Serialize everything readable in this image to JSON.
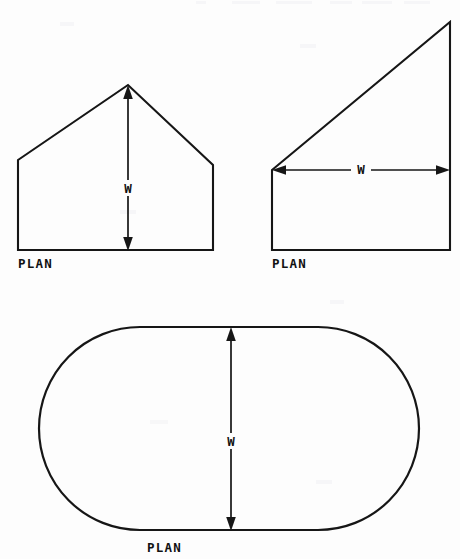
{
  "document": {
    "kind": "scanned-technical-diagram",
    "page_background": "#fdfdfd",
    "ink_color": "#161616",
    "top_artifact_text": ""
  },
  "figures": [
    {
      "id": "figure-pentagon",
      "name": "pentagon-gable-plan",
      "shape_type": "pentagon",
      "caption": "PLAN",
      "dimension": {
        "label": "W",
        "orientation": "vertical",
        "both_ends_arrow": true
      },
      "geometry": {
        "points": "18,160 128,85 213,165 213,250 18,250",
        "apex_x": 128,
        "apex_y": 85,
        "base_y": 250,
        "left_x": 18,
        "right_x": 213,
        "left_shoulder_y": 160,
        "right_shoulder_y": 165
      },
      "dim_geometry": {
        "x": 128,
        "y_top": 86,
        "y_bottom": 250,
        "label_y": 188
      },
      "caption_pos": {
        "x": 18,
        "y": 268
      }
    },
    {
      "id": "figure-triangle",
      "name": "right-triangle-plan",
      "shape_type": "right-triangle-over-rectangle",
      "caption": "PLAN",
      "dimension": {
        "label": "W",
        "orientation": "horizontal",
        "both_ends_arrow": true
      },
      "geometry": {
        "points": "272,170 450,22 450,250 272,250",
        "apex_x": 450,
        "apex_y": 22,
        "base_y": 250,
        "left_x": 272,
        "right_x": 450,
        "left_corner_y": 170
      },
      "dim_geometry": {
        "y": 170,
        "x_left": 273,
        "x_right": 449,
        "label_x": 361
      },
      "caption_pos": {
        "x": 272,
        "y": 268
      }
    },
    {
      "id": "figure-stadium",
      "name": "stadium-oval-plan",
      "shape_type": "stadium",
      "caption": "PLAN",
      "dimension": {
        "label": "W",
        "orientation": "vertical",
        "both_ends_arrow": true
      },
      "geometry": {
        "left_x": 39,
        "right_x": 419,
        "top_y": 327,
        "bottom_y": 530,
        "radius": 101
      },
      "dim_geometry": {
        "x": 231,
        "y_top": 328,
        "y_bottom": 529,
        "label_y": 441
      },
      "caption_pos": {
        "x": 147,
        "y": 552
      }
    }
  ]
}
